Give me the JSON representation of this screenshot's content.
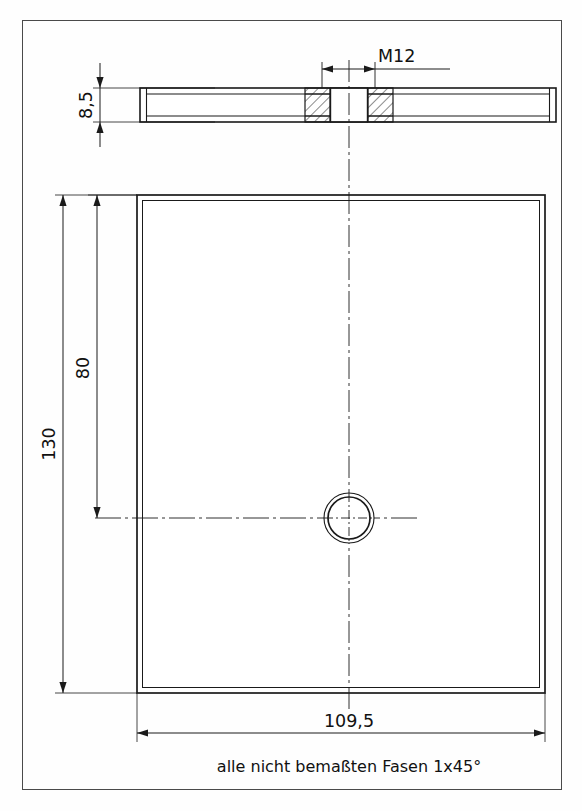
{
  "drawing": {
    "title": "Platte mit Gewindebohrung M12",
    "units": "mm",
    "note": "alle nicht bemaßten Fasen 1x45°",
    "line_color": "#1a1a1a",
    "background_color": "#fefefe",
    "views": [
      {
        "name": "side-view",
        "type": "section",
        "description": "Seitenansicht / Schnitt durch Gewindebohrung"
      },
      {
        "name": "front-view",
        "type": "plan",
        "description": "Draufsicht der Platte"
      }
    ],
    "dimensions": {
      "thickness": "8,5",
      "thread": "M12",
      "height_total": "130",
      "height_to_hole": "80",
      "width": "109,5"
    }
  }
}
